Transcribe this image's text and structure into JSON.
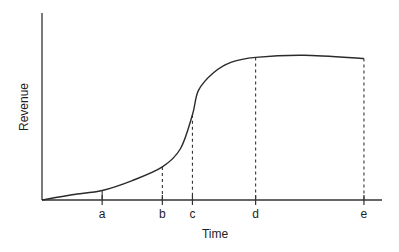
{
  "chart_data": {
    "type": "line",
    "title": "",
    "xlabel": "Time",
    "ylabel": "Revenue",
    "grid": false,
    "legend": "none",
    "x_ticks": [
      {
        "label": "a",
        "x": 2.0,
        "guide": "solid"
      },
      {
        "label": "b",
        "x": 4.0,
        "guide": "dashed"
      },
      {
        "label": "c",
        "x": 5.0,
        "guide": "dashed"
      },
      {
        "label": "d",
        "x": 7.1,
        "guide": "dashed"
      },
      {
        "label": "e",
        "x": 10.7,
        "guide": "dashed"
      }
    ],
    "xlim": [
      0,
      11.3
    ],
    "ylim": [
      0,
      1.0
    ],
    "series": [
      {
        "name": "Revenue curve (S-curve / product life cycle)",
        "points": [
          [
            0.0,
            0.0
          ],
          [
            1.0,
            0.03
          ],
          [
            2.0,
            0.054
          ],
          [
            3.0,
            0.11
          ],
          [
            4.0,
            0.187
          ],
          [
            4.6,
            0.29
          ],
          [
            5.0,
            0.482
          ],
          [
            5.2,
            0.62
          ],
          [
            5.7,
            0.72
          ],
          [
            6.3,
            0.78
          ],
          [
            7.1,
            0.807
          ],
          [
            8.7,
            0.819
          ],
          [
            10.7,
            0.801
          ]
        ]
      }
    ]
  }
}
